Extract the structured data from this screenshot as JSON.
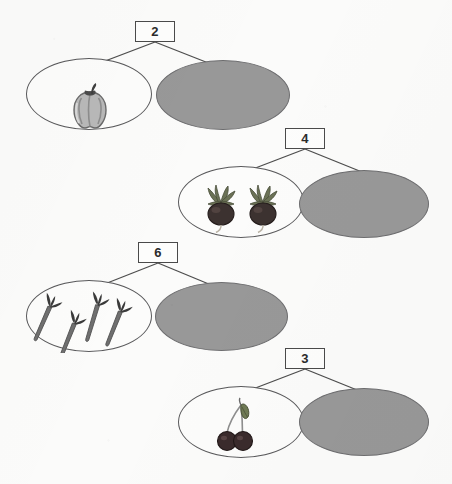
{
  "worksheet": {
    "title": "Number bonds with fruit and vegetable pictures",
    "background_color": "#fbfbfa",
    "blank_ellipse_color": "#989898",
    "outline_color": "#59595b"
  },
  "groups": [
    {
      "id": "group-1",
      "number": "2",
      "item_name": "bell-pepper",
      "item_count": 1,
      "item_label": "bell pepper",
      "blank_label": ""
    },
    {
      "id": "group-2",
      "number": "4",
      "item_name": "beet",
      "item_count": 2,
      "item_label": "beets",
      "blank_label": ""
    },
    {
      "id": "group-3",
      "number": "6",
      "item_name": "carrot",
      "item_count": 4,
      "item_label": "carrots",
      "blank_label": ""
    },
    {
      "id": "group-4",
      "number": "3",
      "item_name": "cherry",
      "item_count": 2,
      "item_label": "cherries",
      "blank_label": ""
    }
  ]
}
